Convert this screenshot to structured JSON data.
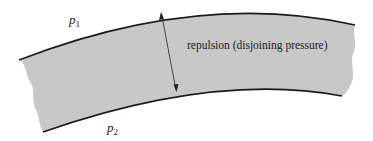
{
  "diagram": {
    "labels": {
      "upper_pressure": {
        "symbol": "p",
        "subscript": "1"
      },
      "lower_pressure": {
        "symbol": "p",
        "subscript": "2"
      },
      "arrow_label": "repulsion (disjoining pressure)"
    },
    "colors": {
      "film_fill": "#c8c8c8",
      "boundary_stroke": "#1a1a1a",
      "background": "#ffffff"
    }
  }
}
